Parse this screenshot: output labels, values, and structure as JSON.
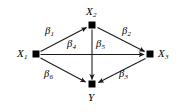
{
  "diagram": {
    "type": "path-diagram",
    "background_color": "#ffffff",
    "stroke_color": "#1a1a1a",
    "node_color": "#000000",
    "nodes": [
      {
        "id": "X1",
        "label": "X",
        "subscript": "1",
        "x": 36,
        "y": 54,
        "label_position": "left"
      },
      {
        "id": "X2",
        "label": "X",
        "subscript": "2",
        "x": 92,
        "y": 25,
        "label_position": "above"
      },
      {
        "id": "X3",
        "label": "X",
        "subscript": "3",
        "x": 150,
        "y": 54,
        "label_position": "right"
      },
      {
        "id": "Y",
        "label": "Y",
        "subscript": "",
        "x": 92,
        "y": 84,
        "label_position": "below"
      }
    ],
    "edges": [
      {
        "id": "e1",
        "from": "X1",
        "to": "X2",
        "label": "β",
        "subscript": "1"
      },
      {
        "id": "e2",
        "from": "X2",
        "to": "X3",
        "label": "β",
        "subscript": "2"
      },
      {
        "id": "e3",
        "from": "X3",
        "to": "Y",
        "label": "β",
        "subscript": "3"
      },
      {
        "id": "e4",
        "from": "X1",
        "to": "X3",
        "label": "β",
        "subscript": "4"
      },
      {
        "id": "e5",
        "from": "X2",
        "to": "Y",
        "label": "β",
        "subscript": "5"
      },
      {
        "id": "e6",
        "from": "X1",
        "to": "Y",
        "label": "β",
        "subscript": "6"
      }
    ],
    "labels": {
      "x1": "X",
      "x1_sub": "1",
      "x2": "X",
      "x2_sub": "2",
      "x3": "X",
      "x3_sub": "3",
      "y": "Y",
      "beta1": "β",
      "beta1_sub": "1",
      "beta2": "β",
      "beta2_sub": "2",
      "beta3": "β",
      "beta3_sub": "3",
      "beta4": "β",
      "beta4_sub": "4",
      "beta5": "β",
      "beta5_sub": "5",
      "beta6": "β",
      "beta6_sub": "6"
    }
  }
}
